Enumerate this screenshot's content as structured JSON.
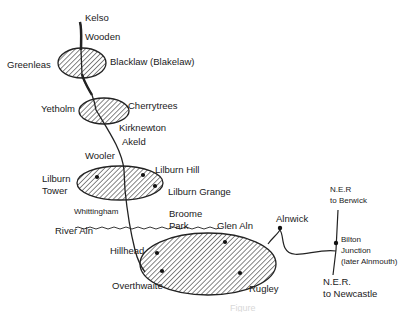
{
  "places": {
    "kelso": "Kelso",
    "wooden": "Wooden",
    "greenleas": "Greenleas",
    "blacklaw": "Blacklaw (Blakelaw)",
    "yetholm": "Yetholm",
    "cherrytrees": "Cherrytrees",
    "kirknewton": "Kirknewton",
    "akeld": "Akeld",
    "wooler": "Wooler",
    "lilburn_hill": "Lilburn Hill",
    "lilburn_tower_1": "Lilburn",
    "lilburn_tower_2": "Tower",
    "lilburn_grange": "Lilburn Grange",
    "whittingham": "Whittingham",
    "river_aln": "River Aln",
    "broome_park_1": "Broome",
    "broome_park_2": "Park",
    "glen_aln": "Glen Aln",
    "alnwick": "Alnwick",
    "hillhead": "Hillhead",
    "overthwaite": "Overthwaite",
    "rugley": "Rugley",
    "ner_berwick_1": "N.E.R",
    "ner_berwick_2": "to Berwick",
    "bilton_1": "Bilton",
    "bilton_2": "Junction",
    "bilton_3": "(later Alnmouth)",
    "ner_newcastle_1": "N.E.R.",
    "ner_newcastle_2": "to Newcastle"
  },
  "caption": "Figure"
}
